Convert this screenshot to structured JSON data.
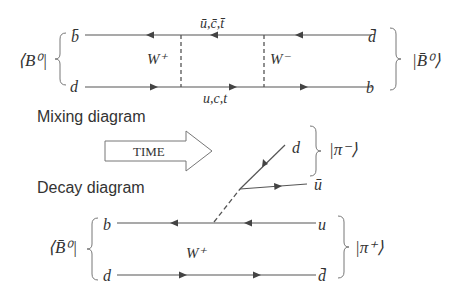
{
  "mixing": {
    "caption": "Mixing diagram",
    "initial_state": "⟨B⁰|",
    "final_state": "|B̄⁰⟩",
    "top_left": "b̄",
    "bottom_left": "d",
    "top_right": "d̄",
    "bottom_right": "b",
    "top_internal": "ū,c̄,t̄",
    "bottom_internal": "u,c,t",
    "w_left": "W⁺",
    "w_right": "W⁻"
  },
  "arrow": {
    "label": "TIME"
  },
  "decay": {
    "caption": "Decay diagram",
    "initial_state": "⟨B̄⁰|",
    "top_left": "b",
    "bottom_left": "d",
    "top_right": "u",
    "bottom_right": "d̄",
    "w_label": "W⁺",
    "pion_plus": "|π⁺⟩",
    "pion_minus": "|π⁻⟩",
    "branch_top": "d",
    "branch_bottom": "ū"
  },
  "colors": {
    "line": "#444444",
    "text": "#333333",
    "background": "#ffffff"
  }
}
